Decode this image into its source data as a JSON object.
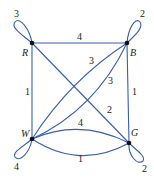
{
  "diagram": {
    "type": "multigraph",
    "edge_color": "#3a5ea8",
    "node_color": "#111111",
    "nodes": [
      {
        "id": "R",
        "label": "R"
      },
      {
        "id": "B",
        "label": "B"
      },
      {
        "id": "W",
        "label": "W"
      },
      {
        "id": "G",
        "label": "G"
      }
    ],
    "edges": [
      {
        "from": "R",
        "to": "R",
        "kind": "loop",
        "weight": "3"
      },
      {
        "from": "B",
        "to": "B",
        "kind": "loop",
        "weight": "2"
      },
      {
        "from": "W",
        "to": "W",
        "kind": "loop",
        "weight": "4"
      },
      {
        "from": "G",
        "to": "G",
        "kind": "loop",
        "weight": "2"
      },
      {
        "from": "R",
        "to": "B",
        "kind": "straight",
        "weight": "4"
      },
      {
        "from": "R",
        "to": "W",
        "kind": "straight",
        "weight": "1"
      },
      {
        "from": "B",
        "to": "G",
        "kind": "straight",
        "weight": "1"
      },
      {
        "from": "R",
        "to": "G",
        "kind": "straight",
        "weight": "2"
      },
      {
        "from": "W",
        "to": "B",
        "kind": "curve-upper",
        "weight": "3"
      },
      {
        "from": "W",
        "to": "B",
        "kind": "curve-lower",
        "weight": "3"
      },
      {
        "from": "W",
        "to": "G",
        "kind": "curve-upper",
        "weight": "4"
      },
      {
        "from": "W",
        "to": "G",
        "kind": "curve-lower",
        "weight": "1"
      }
    ]
  }
}
